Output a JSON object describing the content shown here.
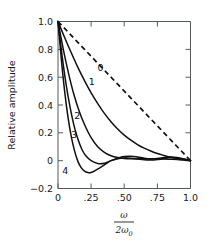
{
  "chart_data": {
    "type": "line",
    "title": "",
    "xlabel": "ω / 2ω₀",
    "ylabel": "Relative amplitude",
    "xlim": [
      0.0,
      1.0
    ],
    "ylim": [
      -0.2,
      1.0
    ],
    "grid": false,
    "legend": "inline curve labels",
    "xticks": [
      0.0,
      0.25,
      0.5,
      0.75,
      1.0
    ],
    "xtick_labels": [
      "0",
      ".25",
      ".50",
      ".75",
      "1.0"
    ],
    "yticks": [
      -0.2,
      0.0,
      0.2,
      0.4,
      0.6,
      0.8,
      1.0
    ],
    "ytick_labels": [
      "−0.2",
      "0",
      "0.2",
      "0.4",
      "0.6",
      "0.8",
      "1.0"
    ],
    "series": [
      {
        "name": "0",
        "label": "0",
        "style": "dashed",
        "label_x": 0.32,
        "label_y": 0.67,
        "x": [
          0.0,
          0.05,
          0.1,
          0.15,
          0.2,
          0.25,
          0.3,
          0.35,
          0.4,
          0.45,
          0.5,
          0.55,
          0.6,
          0.65,
          0.7,
          0.75,
          0.8,
          0.85,
          0.9,
          0.95,
          1.0
        ],
        "values": [
          1.0,
          0.95,
          0.9,
          0.85,
          0.8,
          0.75,
          0.7,
          0.65,
          0.6,
          0.55,
          0.5,
          0.45,
          0.4,
          0.35,
          0.3,
          0.25,
          0.2,
          0.15,
          0.1,
          0.05,
          0.0
        ]
      },
      {
        "name": "1",
        "label": "1",
        "style": "solid",
        "label_x": 0.255,
        "label_y": 0.565,
        "x": [
          0.0,
          0.05,
          0.1,
          0.15,
          0.2,
          0.25,
          0.3,
          0.35,
          0.4,
          0.45,
          0.5,
          0.55,
          0.6,
          0.65,
          0.7,
          0.75,
          0.8,
          0.85,
          0.9,
          0.95,
          1.0
        ],
        "values": [
          1.0,
          0.885,
          0.775,
          0.67,
          0.575,
          0.487,
          0.41,
          0.34,
          0.28,
          0.228,
          0.184,
          0.147,
          0.116,
          0.09,
          0.069,
          0.051,
          0.037,
          0.025,
          0.015,
          0.007,
          0.0
        ]
      },
      {
        "name": "2",
        "label": "2",
        "style": "solid",
        "label_x": 0.145,
        "label_y": 0.32,
        "x": [
          0.0,
          0.04,
          0.08,
          0.12,
          0.16,
          0.2,
          0.25,
          0.3,
          0.35,
          0.4,
          0.45,
          0.5,
          0.55,
          0.6,
          0.65,
          0.7,
          0.75,
          0.8,
          0.85,
          0.9,
          0.95,
          1.0
        ],
        "values": [
          1.0,
          0.8,
          0.625,
          0.475,
          0.355,
          0.26,
          0.165,
          0.1,
          0.06,
          0.035,
          0.022,
          0.016,
          0.014,
          0.014,
          0.014,
          0.014,
          0.013,
          0.012,
          0.01,
          0.008,
          0.004,
          0.0
        ]
      },
      {
        "name": "3",
        "label": "3",
        "style": "solid",
        "label_x": 0.12,
        "label_y": 0.185,
        "x": [
          0.0,
          0.03,
          0.06,
          0.09,
          0.12,
          0.15,
          0.18,
          0.21,
          0.25,
          0.3,
          0.35,
          0.4,
          0.45,
          0.5,
          0.55,
          0.6,
          0.65,
          0.7,
          0.75,
          0.8,
          0.85,
          0.9,
          0.95,
          1.0
        ],
        "values": [
          1.0,
          0.76,
          0.555,
          0.39,
          0.255,
          0.155,
          0.082,
          0.035,
          0.0,
          -0.02,
          -0.018,
          0.0,
          0.018,
          0.03,
          0.032,
          0.026,
          0.018,
          0.014,
          0.016,
          0.022,
          0.026,
          0.022,
          0.012,
          0.0
        ]
      },
      {
        "name": "4",
        "label": "4",
        "style": "solid",
        "label_x": 0.055,
        "label_y": -0.072,
        "x": [
          0.0,
          0.025,
          0.05,
          0.075,
          0.1,
          0.125,
          0.15,
          0.175,
          0.2,
          0.225,
          0.25,
          0.28,
          0.31,
          0.35,
          0.4,
          0.45,
          0.5,
          0.55,
          0.6,
          0.65,
          0.7,
          0.75,
          0.8,
          0.85,
          0.9,
          0.95,
          1.0
        ],
        "values": [
          1.0,
          0.73,
          0.5,
          0.315,
          0.175,
          0.07,
          -0.005,
          -0.05,
          -0.075,
          -0.085,
          -0.085,
          -0.072,
          -0.055,
          -0.03,
          0.0,
          0.014,
          0.02,
          0.018,
          0.012,
          0.006,
          0.004,
          0.008,
          0.016,
          0.022,
          0.02,
          0.012,
          0.0
        ]
      }
    ]
  },
  "axis": {
    "y_title": "Relative amplitude",
    "x_numerator": "ω",
    "x_denominator_coef": "2",
    "x_denominator_sym": "ω",
    "x_denominator_sub": "0"
  }
}
